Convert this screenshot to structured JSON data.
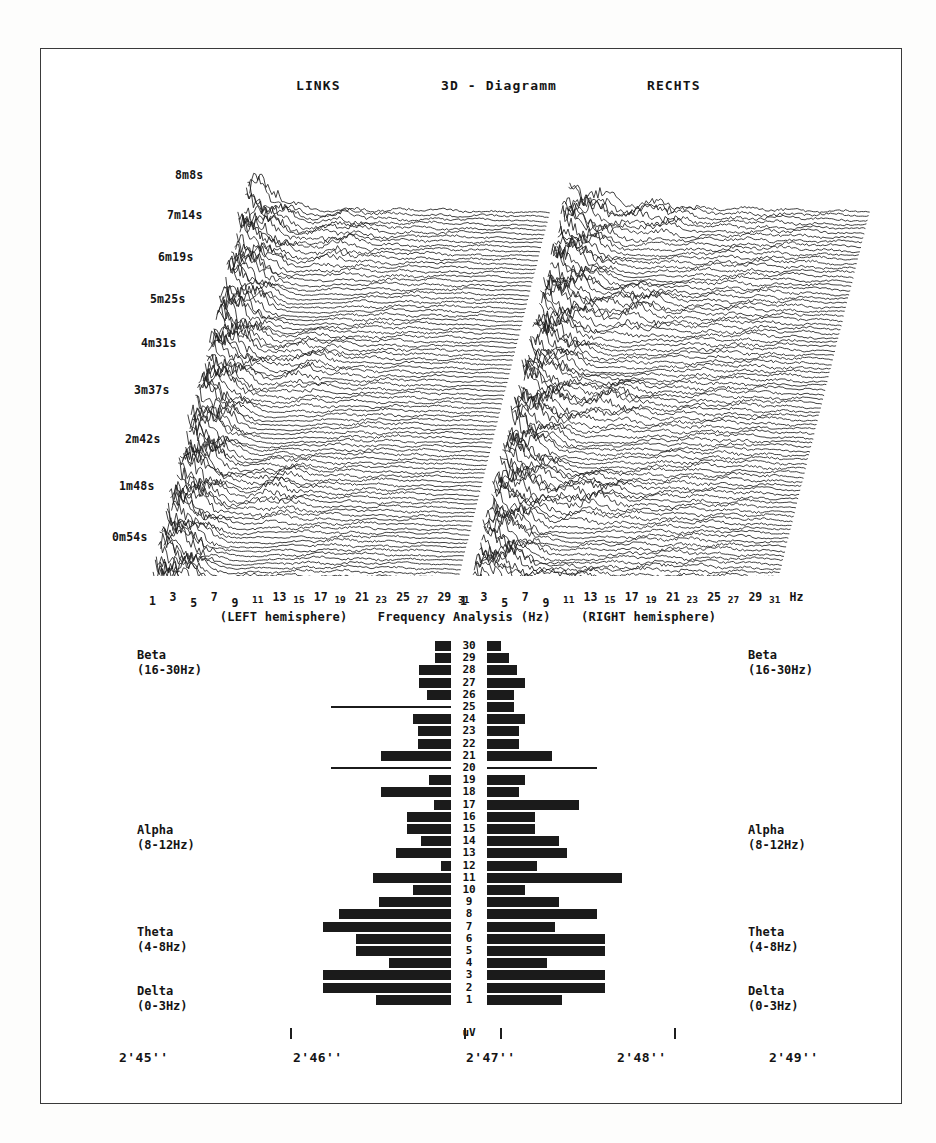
{
  "figure": {
    "frame_color": "#3a3a3a",
    "ink_color": "#1b1b1b",
    "background": "#ffffff"
  },
  "waterfall": {
    "left_label": "LINKS",
    "title": "3D - Diagramm",
    "right_label": "RECHTS",
    "time_labels": [
      "8m8s",
      "7m14s",
      "6m19s",
      "5m25s",
      "4m31s",
      "3m37s",
      "2m42s",
      "1m48s",
      "0m54s"
    ]
  },
  "frequency_axis": {
    "caption_left": "(LEFT hemisphere)",
    "caption_center": "Frequency Analysis (Hz)",
    "caption_right": "(RIGHT hemisphere)",
    "unit": "Hz",
    "ticks": [
      "1",
      "3",
      "5",
      "7",
      "9",
      "11",
      "13",
      "15",
      "17",
      "19",
      "21",
      "23",
      "25",
      "27",
      "29",
      "31"
    ]
  },
  "bands": {
    "beta": {
      "name": "Beta",
      "range": "(16-30Hz)"
    },
    "alpha": {
      "name": "Alpha",
      "range": "(8-12Hz)"
    },
    "theta": {
      "name": "Theta",
      "range": "(4-8Hz)"
    },
    "delta": {
      "name": "Delta",
      "range": "(0-3Hz)"
    }
  },
  "bar_panel": {
    "unit": "uV",
    "row_labels": [
      "30",
      "29",
      "28",
      "27",
      "26",
      "25",
      "24",
      "23",
      "22",
      "21",
      "20",
      "19",
      "18",
      "17",
      "16",
      "15",
      "14",
      "13",
      "12",
      "11",
      "10",
      "9",
      "8",
      "7",
      "6",
      "5",
      "4",
      "3",
      "2",
      "1"
    ]
  },
  "time_axis": {
    "marks": [
      "2'45''",
      "2'46''",
      "2'47''",
      "2'48''",
      "2'49''"
    ]
  },
  "chart_data": {
    "type": "bar",
    "title": "Frequency Analysis (Hz)",
    "xlabel": "uV",
    "ylabel": "Frequency (Hz)",
    "orientation": "horizontal-diverging",
    "categories": [
      "30",
      "29",
      "28",
      "27",
      "26",
      "25",
      "24",
      "23",
      "22",
      "21",
      "20",
      "19",
      "18",
      "17",
      "16",
      "15",
      "14",
      "13",
      "12",
      "11",
      "10",
      "9",
      "8",
      "7",
      "6",
      "5",
      "4",
      "3",
      "2",
      "1"
    ],
    "series": [
      {
        "name": "LEFT hemisphere",
        "direction": "left",
        "values": [
          16,
          16,
          32,
          32,
          24,
          1,
          38,
          33,
          33,
          70,
          1,
          22,
          70,
          17,
          44,
          44,
          30,
          55,
          10,
          78,
          38,
          72,
          112,
          128,
          95,
          95,
          62,
          128,
          128,
          75
        ]
      },
      {
        "name": "RIGHT hemisphere",
        "direction": "right",
        "values": [
          14,
          22,
          30,
          38,
          27,
          27,
          38,
          32,
          32,
          65,
          1,
          38,
          32,
          92,
          48,
          48,
          72,
          80,
          50,
          135,
          38,
          72,
          110,
          68,
          118,
          118,
          60,
          118,
          118,
          75
        ]
      }
    ],
    "bands": [
      {
        "label": "Beta",
        "range": "(16-30Hz)"
      },
      {
        "label": "Alpha",
        "range": "(8-12Hz)"
      },
      {
        "label": "Theta",
        "range": "(4-8Hz)"
      },
      {
        "label": "Delta",
        "range": "(0-3Hz)"
      }
    ],
    "grid": false,
    "legend": "none"
  },
  "waterfall_data": {
    "type": "line",
    "description": "Stacked EEG spectral traces (waterfall / 3D diagram), two hemispheres",
    "trace_count": 90,
    "x_range_hz": [
      1,
      31
    ],
    "time_range": [
      "0m54s",
      "8m8s"
    ],
    "panels": [
      "LINKS",
      "RECHTS"
    ]
  }
}
